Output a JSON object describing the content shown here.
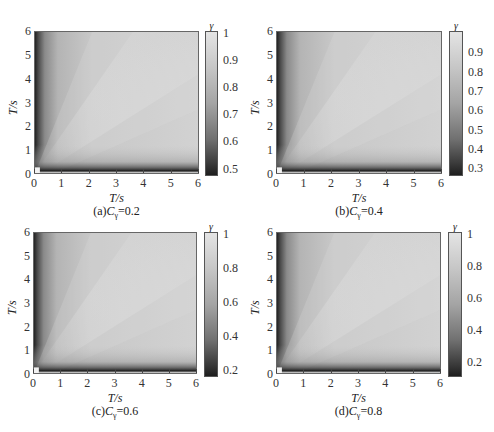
{
  "chart_data": [
    {
      "type": "heatmap",
      "panel": "a",
      "caption_prefix": "(a)",
      "caption_var": "C",
      "caption_sub": "γ",
      "caption_value": "=0.2",
      "xlabel": "T/s",
      "ylabel": "T/s",
      "x_ticks": [
        "0",
        "1",
        "2",
        "3",
        "4",
        "5",
        "6"
      ],
      "y_ticks": [
        "0",
        "1",
        "2",
        "3",
        "4",
        "5",
        "6"
      ],
      "xlim": [
        0,
        6
      ],
      "ylim": [
        0,
        6
      ],
      "colorbar_label": "γ",
      "colorbar_ticks": [
        "1",
        "0.9",
        "0.8",
        "0.7",
        "0.6",
        "0.5"
      ],
      "colorbar_range": [
        0.48,
        1.0
      ],
      "colormap": "gray",
      "description": "Coherence γ between periods; high (~0.95-1) across most of the domain, brighter band along the diagonal, dark strips (~0.5) near T=0 on both axes"
    },
    {
      "type": "heatmap",
      "panel": "b",
      "caption_prefix": "(b)",
      "caption_var": "C",
      "caption_sub": "γ",
      "caption_value": "=0.4",
      "xlabel": "T/s",
      "ylabel": "T/s",
      "x_ticks": [
        "0",
        "1",
        "2",
        "3",
        "4",
        "5",
        "6"
      ],
      "y_ticks": [
        "0",
        "1",
        "2",
        "3",
        "4",
        "5",
        "6"
      ],
      "xlim": [
        0,
        6
      ],
      "ylim": [
        0,
        6
      ],
      "colorbar_label": "γ",
      "colorbar_ticks": [
        "0.9",
        "0.8",
        "0.7",
        "0.6",
        "0.5",
        "0.4",
        "0.3"
      ],
      "colorbar_range": [
        0.27,
        1.0
      ],
      "colormap": "gray",
      "description": "Similar pattern with dark strips (~0.3) near T=0"
    },
    {
      "type": "heatmap",
      "panel": "c",
      "caption_prefix": "(c)",
      "caption_var": "C",
      "caption_sub": "γ",
      "caption_value": "=0.6",
      "xlabel": "T/s",
      "ylabel": "T/s",
      "x_ticks": [
        "0",
        "1",
        "2",
        "3",
        "4",
        "5",
        "6"
      ],
      "y_ticks": [
        "0",
        "1",
        "2",
        "3",
        "4",
        "5",
        "6"
      ],
      "xlim": [
        0,
        6
      ],
      "ylim": [
        0,
        6
      ],
      "colorbar_label": "γ",
      "colorbar_ticks": [
        "1",
        "0.8",
        "0.6",
        "0.4",
        "0.2"
      ],
      "colorbar_range": [
        0.17,
        1.0
      ],
      "colormap": "gray",
      "description": "Similar pattern with dark strips (~0.2) near T=0"
    },
    {
      "type": "heatmap",
      "panel": "d",
      "caption_prefix": "(d)",
      "caption_var": "C",
      "caption_sub": "γ",
      "caption_value": "=0.8",
      "xlabel": "T/s",
      "ylabel": "T/s",
      "x_ticks": [
        "0",
        "1",
        "2",
        "3",
        "4",
        "5",
        "6"
      ],
      "y_ticks": [
        "0",
        "1",
        "2",
        "3",
        "4",
        "5",
        "6"
      ],
      "xlim": [
        0,
        6
      ],
      "ylim": [
        0,
        6
      ],
      "colorbar_label": "γ",
      "colorbar_ticks": [
        "1",
        "0.8",
        "0.6",
        "0.4",
        "0.2"
      ],
      "colorbar_range": [
        0.12,
        1.0
      ],
      "colormap": "gray",
      "description": "Similar pattern with dark strips (~0.15) near T=0"
    }
  ],
  "layout": {
    "panels": [
      {
        "plot": [
          34,
          31,
          165,
          143
        ],
        "cbar": [
          205,
          31,
          13,
          145
        ],
        "cbar_ticks_pos": [
          0,
          0.192,
          0.385,
          0.577,
          0.769,
          0.962
        ]
      },
      {
        "plot": [
          276,
          31,
          166,
          143
        ],
        "cbar": [
          449,
          31,
          14,
          145
        ],
        "cbar_ticks_pos": [
          0.137,
          0.274,
          0.411,
          0.548,
          0.685,
          0.822,
          0.959
        ]
      },
      {
        "plot": [
          33,
          232,
          164,
          142
        ],
        "cbar": [
          204,
          232,
          14,
          145
        ],
        "cbar_ticks_pos": [
          0,
          0.241,
          0.482,
          0.723,
          0.964
        ]
      },
      {
        "plot": [
          276,
          232,
          165,
          142
        ],
        "cbar": [
          448,
          232,
          14,
          145
        ],
        "cbar_ticks_pos": [
          0,
          0.227,
          0.455,
          0.682,
          0.909
        ]
      }
    ]
  }
}
